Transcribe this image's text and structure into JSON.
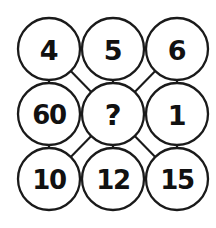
{
  "diagram": {
    "background_color": "#ffffff",
    "stroke_color": "#1a1a1a",
    "text_color": "#111111",
    "grid": {
      "rows": 3,
      "cols": 3,
      "radius": 31,
      "spacing_x": 64,
      "spacing_y": 65
    },
    "nodes": [
      {
        "id": "n-r1c1",
        "label": "4",
        "row": 1,
        "col": 1,
        "cx": 49,
        "cy": 49,
        "style": "normal"
      },
      {
        "id": "n-r1c2",
        "label": "5",
        "row": 1,
        "col": 2,
        "cx": 113,
        "cy": 49,
        "style": "normal"
      },
      {
        "id": "n-r1c3",
        "label": "6",
        "row": 1,
        "col": 3,
        "cx": 177,
        "cy": 49,
        "style": "normal"
      },
      {
        "id": "n-r2c1",
        "label": "60",
        "row": 2,
        "col": 1,
        "cx": 49,
        "cy": 114,
        "style": "wide"
      },
      {
        "id": "n-r2c2",
        "label": "?",
        "row": 2,
        "col": 2,
        "cx": 113,
        "cy": 114,
        "style": "query"
      },
      {
        "id": "n-r2c3",
        "label": "1",
        "row": 2,
        "col": 3,
        "cx": 177,
        "cy": 114,
        "style": "normal"
      },
      {
        "id": "n-r3c1",
        "label": "10",
        "row": 3,
        "col": 1,
        "cx": 49,
        "cy": 179,
        "style": "wide"
      },
      {
        "id": "n-r3c2",
        "label": "12",
        "row": 3,
        "col": 2,
        "cx": 113,
        "cy": 179,
        "style": "wide"
      },
      {
        "id": "n-r3c3",
        "label": "15",
        "row": 3,
        "col": 3,
        "cx": 177,
        "cy": 179,
        "style": "wide"
      }
    ],
    "edges": [
      {
        "id": "e-4-5",
        "from": "n-r1c1",
        "to": "n-r1c2",
        "kind": "horizontal"
      },
      {
        "id": "e-5-6",
        "from": "n-r1c2",
        "to": "n-r1c3",
        "kind": "horizontal"
      },
      {
        "id": "e-60-center",
        "from": "n-r2c1",
        "to": "n-r2c2",
        "kind": "horizontal"
      },
      {
        "id": "e-center-1",
        "from": "n-r2c2",
        "to": "n-r2c3",
        "kind": "horizontal"
      },
      {
        "id": "e-10-12",
        "from": "n-r3c1",
        "to": "n-r3c2",
        "kind": "horizontal"
      },
      {
        "id": "e-12-15",
        "from": "n-r3c2",
        "to": "n-r3c3",
        "kind": "horizontal"
      },
      {
        "id": "e-4-60",
        "from": "n-r1c1",
        "to": "n-r2c1",
        "kind": "vertical"
      },
      {
        "id": "e-5-center",
        "from": "n-r1c2",
        "to": "n-r2c2",
        "kind": "vertical"
      },
      {
        "id": "e-6-1",
        "from": "n-r1c3",
        "to": "n-r2c3",
        "kind": "vertical"
      },
      {
        "id": "e-60-10",
        "from": "n-r2c1",
        "to": "n-r3c1",
        "kind": "vertical"
      },
      {
        "id": "e-center-12",
        "from": "n-r2c2",
        "to": "n-r3c2",
        "kind": "vertical"
      },
      {
        "id": "e-1-15",
        "from": "n-r2c3",
        "to": "n-r3c3",
        "kind": "vertical"
      },
      {
        "id": "e-4-center",
        "from": "n-r1c1",
        "to": "n-r2c2",
        "kind": "diagonal"
      },
      {
        "id": "e-6-center",
        "from": "n-r1c3",
        "to": "n-r2c2",
        "kind": "diagonal"
      },
      {
        "id": "e-10-center",
        "from": "n-r3c1",
        "to": "n-r2c2",
        "kind": "diagonal"
      },
      {
        "id": "e-15-center",
        "from": "n-r3c3",
        "to": "n-r2c2",
        "kind": "diagonal"
      }
    ]
  }
}
